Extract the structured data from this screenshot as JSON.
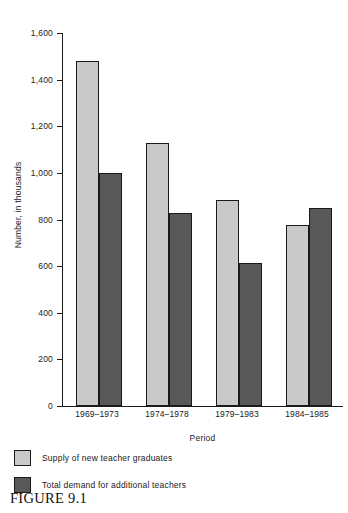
{
  "figure": {
    "caption": "FIGURE 9.1"
  },
  "chart_data": {
    "type": "bar",
    "title": "",
    "subtitle": "",
    "xlabel": "Period",
    "ylabel": "Number, in thousands",
    "categories": [
      "1969–1973",
      "1974–1978",
      "1979–1983",
      "1984–1985"
    ],
    "series": [
      {
        "name": "Supply of new teacher graduates",
        "color": "#c9c9c9",
        "values": [
          1480,
          1130,
          885,
          775
        ]
      },
      {
        "name": "Total demand for additional teachers",
        "color": "#585858",
        "values": [
          1000,
          830,
          615,
          850
        ]
      }
    ],
    "ylim": [
      0,
      1600
    ],
    "ytick_step": 200,
    "ytick_labels": [
      "0",
      "200",
      "400",
      "600",
      "800",
      "1,000",
      "1,200",
      "1,400",
      "1,600"
    ],
    "ytick_values": [
      0,
      200,
      400,
      600,
      800,
      1000,
      1200,
      1400,
      1600
    ],
    "grid": false,
    "legend_position": "below-plot",
    "bar_border_color": "#1a1a1a",
    "axis_color": "#1a1a1a"
  }
}
